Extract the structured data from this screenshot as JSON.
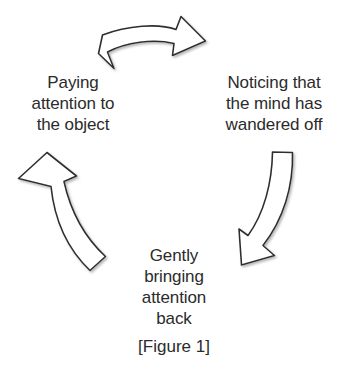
{
  "figure": {
    "caption": "[Figure 1]",
    "background_color": "#ffffff",
    "text_color": "#2b2b2b",
    "arrow_stroke_color": "#2e2e2e",
    "arrow_fill_color": "#ffffff",
    "arrow_shadow_color": "#bdbdbd"
  },
  "nodes": [
    {
      "id": "paying",
      "label": "Paying\nattention to\nthe object"
    },
    {
      "id": "noticing",
      "label": "Noticing that\nthe mind has\nwandered off"
    },
    {
      "id": "gently",
      "label": "Gently\nbringing\nattention\nback"
    }
  ],
  "arrows": [
    {
      "id": "top",
      "from": "paying",
      "to": "noticing",
      "direction": "left-to-right-curving-down"
    },
    {
      "id": "right",
      "from": "noticing",
      "to": "gently",
      "direction": "top-to-bottom-curving-left"
    },
    {
      "id": "left",
      "from": "gently",
      "to": "paying",
      "direction": "bottom-to-top-curving-up"
    }
  ]
}
